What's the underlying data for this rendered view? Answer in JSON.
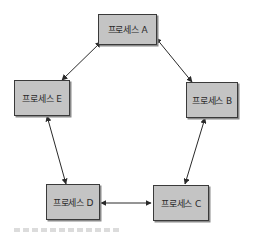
{
  "diagram": {
    "type": "process-communication-ring",
    "nodes": [
      {
        "id": "A",
        "label": "프로세스 A"
      },
      {
        "id": "B",
        "label": "프로세스 B"
      },
      {
        "id": "C",
        "label": "프로세스 C"
      },
      {
        "id": "D",
        "label": "프로세스 D"
      },
      {
        "id": "E",
        "label": "프로세스 E"
      }
    ],
    "edges": [
      {
        "from": "A",
        "to": "B",
        "direction": "bidirectional"
      },
      {
        "from": "B",
        "to": "C",
        "direction": "bidirectional"
      },
      {
        "from": "C",
        "to": "D",
        "direction": "bidirectional"
      },
      {
        "from": "D",
        "to": "E",
        "direction": "bidirectional"
      },
      {
        "from": "E",
        "to": "A",
        "direction": "bidirectional"
      }
    ],
    "colors": {
      "node_fill": "#c4c4c4",
      "node_border": "#3a3a3a",
      "edge": "#2a2a2a"
    }
  }
}
